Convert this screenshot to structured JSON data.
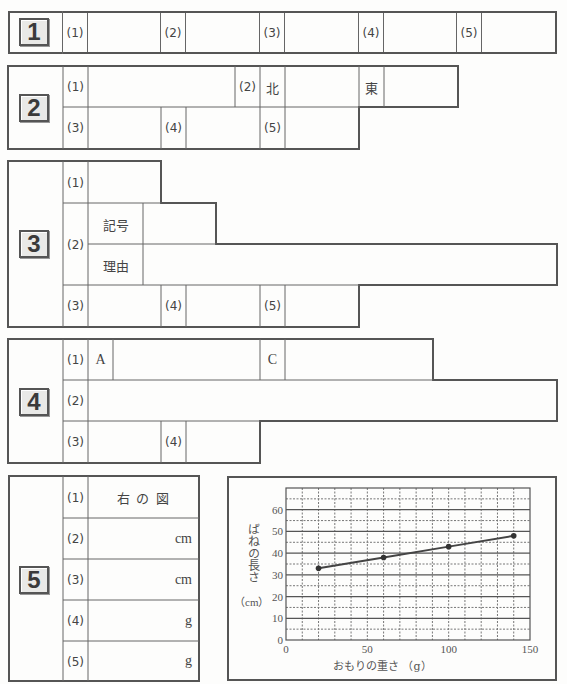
{
  "sections": {
    "s1": {
      "number": "1",
      "items": [
        {
          "label": "(1)"
        },
        {
          "label": "(2)"
        },
        {
          "label": "(3)"
        },
        {
          "label": "(4)"
        },
        {
          "label": "(5)"
        }
      ]
    },
    "s2": {
      "number": "2",
      "items": [
        {
          "label": "(1)"
        },
        {
          "label": "(2)",
          "sub": [
            {
              "label": "北"
            },
            {
              "label": "東"
            }
          ]
        },
        {
          "label": "(3)"
        },
        {
          "label": "(4)"
        },
        {
          "label": "(5)"
        }
      ]
    },
    "s3": {
      "number": "3",
      "items": [
        {
          "label": "(1)"
        },
        {
          "label": "(2)",
          "sub": [
            {
              "label": "記号"
            },
            {
              "label": "理由"
            }
          ]
        },
        {
          "label": "(3)"
        },
        {
          "label": "(4)"
        },
        {
          "label": "(5)"
        }
      ]
    },
    "s4": {
      "number": "4",
      "items": [
        {
          "label": "(1)",
          "sub": [
            {
              "label": "A"
            },
            {
              "label": "C"
            }
          ]
        },
        {
          "label": "(2)"
        },
        {
          "label": "(3)"
        },
        {
          "label": "(4)"
        }
      ]
    },
    "s5": {
      "number": "5",
      "items": [
        {
          "label": "(1)",
          "text": "右 の 図"
        },
        {
          "label": "(2)",
          "unit": "cm"
        },
        {
          "label": "(3)",
          "unit": "cm"
        },
        {
          "label": "(4)",
          "unit": "g"
        },
        {
          "label": "(5)",
          "unit": "g"
        }
      ]
    }
  },
  "chart_data": {
    "type": "line",
    "title": "",
    "xlabel": "おもりの重さ （g）",
    "ylabel": "ばねの長さ",
    "ylabel_unit": "（cm）",
    "x": [
      20,
      60,
      100,
      140
    ],
    "values": [
      33,
      38,
      43,
      48
    ],
    "xlim": [
      0,
      150
    ],
    "ylim": [
      0,
      70
    ],
    "xticks": [
      "0",
      "50",
      "100",
      "150"
    ],
    "yticks": [
      "0",
      "10",
      "20",
      "30",
      "40",
      "50",
      "60"
    ],
    "grid": true,
    "grid_minor": "dotted every 10 g / 5 cm",
    "legend": "none"
  }
}
